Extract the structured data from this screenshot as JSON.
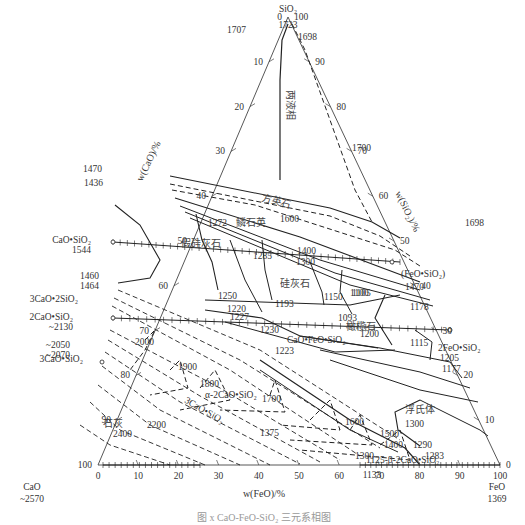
{
  "diagram": {
    "vertices": {
      "sio2": {
        "name": "SiO₂",
        "temp": "1723"
      },
      "cao": {
        "name": "CaO",
        "temp": "~2570"
      },
      "feo": {
        "name": "FeO",
        "temp": "1369"
      }
    },
    "axis_labels": {
      "cao": "w(CaO)/%",
      "sio2": "w(SiO₂)/%",
      "feo": "w(FeO)/%"
    },
    "ticks": {
      "left_cao": [
        "0",
        "10",
        "20",
        "30",
        "40",
        "50",
        "60",
        "70",
        "80",
        "90",
        "100"
      ],
      "right_sio2": [
        "100",
        "90",
        "80",
        "70",
        "60",
        "50",
        "40",
        "30",
        "20",
        "10",
        "0"
      ],
      "bottom_feo": [
        "0",
        "10",
        "20",
        "30",
        "40",
        "50",
        "60",
        "70",
        "80",
        "90",
        "100"
      ]
    },
    "phase_regions": {
      "two_liquid": "两液相",
      "cristobalite": "方英石",
      "tridymite": "鳞石英",
      "pseudowollastonite": "假硅灰石",
      "wollastonite": "硅灰石",
      "olivine": "橄榄石",
      "wustite": "浮氏体",
      "lime": "石灰",
      "alpha_c2s": "α-2CaO•SiO₂",
      "c3s": "3CaO•SiO₂"
    },
    "compounds": {
      "cs": "CaO•SiO₂",
      "c3s2": "3CaO•2SiO₂",
      "c2s": "2CaO•SiO₂",
      "c3s_left": "3CaO•SiO₂",
      "fs": "(FeO•SiO₂)",
      "f2s": "2FeO•SiO₂",
      "cfs": "CaO•FeO•SiO₂",
      "beta_c2s": "1125-β-2CaO•SiO₂"
    },
    "edge_temps": {
      "left": [
        "1707",
        "1470",
        "1436",
        "1544",
        "1460",
        "1464",
        "~2130",
        "~2050",
        "~2070"
      ],
      "right": [
        "1698",
        "1698",
        "1470",
        "1178",
        "1205",
        "1177"
      ],
      "bottom": [
        "1133"
      ]
    },
    "isotherms": [
      "1700",
      "1600",
      "1400",
      "1300",
      "1200",
      "1150",
      "1100",
      "2000",
      "1900",
      "1800",
      "1700",
      "1600",
      "1500",
      "1400",
      "1375",
      "1300",
      "2200",
      "2400",
      "1300",
      "1290",
      "1283",
      "1250"
    ],
    "invariant_points": [
      "1272",
      "1285",
      "1220",
      "1193",
      "1227",
      "1230",
      "1093",
      "1105",
      "1115",
      "1223"
    ],
    "caption": "图 x  CaO-FeO-SiO₂ 三元系相图"
  }
}
